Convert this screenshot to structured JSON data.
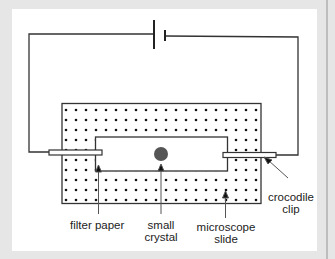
{
  "diagram": {
    "colors": {
      "background": "#e6e6e6",
      "panel": "#ffffff",
      "line": "#333333",
      "crystal": "#555555",
      "dot": "#111111"
    },
    "components": [
      "cell / battery",
      "wires",
      "crocodile clips",
      "filter paper",
      "small crystal",
      "microscope slide"
    ],
    "labels": {
      "filter_paper": "filter paper",
      "small_crystal_line1": "small",
      "small_crystal_line2": "crystal",
      "microscope_slide_line1": "microscope",
      "microscope_slide_line2": "slide",
      "crocodile_clip_line1": "crocodile",
      "crocodile_clip_line2": "clip"
    }
  }
}
